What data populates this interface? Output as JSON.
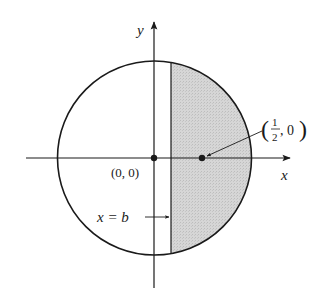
{
  "diagram": {
    "axes": {
      "x_label": "x",
      "y_label": "y"
    },
    "circle": {
      "center_label": "(0, 0)"
    },
    "point": {
      "label_num": "1",
      "label_den": "2",
      "label_rest": ", 0",
      "label_open": "(",
      "label_close": ")"
    },
    "line": {
      "label": "x = b"
    },
    "colors": {
      "stroke": "#1a1a1a",
      "shade": "#d4d4d4",
      "background": "#ffffff"
    }
  }
}
